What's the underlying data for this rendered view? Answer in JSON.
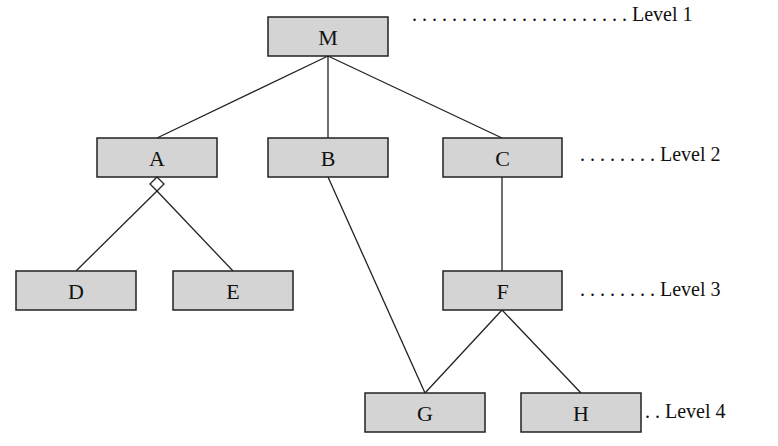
{
  "diagram": {
    "type": "hierarchy",
    "nodes": [
      {
        "id": "M",
        "label": "M",
        "level": 1,
        "x": 268,
        "y": 17,
        "w": 120,
        "h": 39
      },
      {
        "id": "A",
        "label": "A",
        "level": 2,
        "x": 97,
        "y": 138,
        "w": 120,
        "h": 39
      },
      {
        "id": "B",
        "label": "B",
        "level": 2,
        "x": 268,
        "y": 138,
        "w": 120,
        "h": 39
      },
      {
        "id": "C",
        "label": "C",
        "level": 2,
        "x": 443,
        "y": 138,
        "w": 119,
        "h": 39
      },
      {
        "id": "D",
        "label": "D",
        "level": 3,
        "x": 16,
        "y": 271,
        "w": 120,
        "h": 39
      },
      {
        "id": "E",
        "label": "E",
        "level": 3,
        "x": 173,
        "y": 271,
        "w": 120,
        "h": 39
      },
      {
        "id": "F",
        "label": "F",
        "level": 3,
        "x": 443,
        "y": 271,
        "w": 119,
        "h": 39
      },
      {
        "id": "G",
        "label": "G",
        "level": 4,
        "x": 365,
        "y": 393,
        "w": 120,
        "h": 39
      },
      {
        "id": "H",
        "label": "H",
        "level": 4,
        "x": 521,
        "y": 393,
        "w": 120,
        "h": 39
      }
    ],
    "edges": [
      {
        "from": "M",
        "to": "A",
        "x1": 328,
        "y1": 56,
        "x2": 157,
        "y2": 138
      },
      {
        "from": "M",
        "to": "B",
        "x1": 328,
        "y1": 56,
        "x2": 328,
        "y2": 138
      },
      {
        "from": "M",
        "to": "C",
        "x1": 328,
        "y1": 56,
        "x2": 502,
        "y2": 138
      },
      {
        "from": "A",
        "to": "D",
        "x1": 157,
        "y1": 191,
        "x2": 76,
        "y2": 271
      },
      {
        "from": "A",
        "to": "E",
        "x1": 157,
        "y1": 191,
        "x2": 233,
        "y2": 271
      },
      {
        "from": "B",
        "to": "G",
        "x1": 328,
        "y1": 177,
        "x2": 425,
        "y2": 393
      },
      {
        "from": "C",
        "to": "F",
        "x1": 502,
        "y1": 177,
        "x2": 502,
        "y2": 271
      },
      {
        "from": "F",
        "to": "G",
        "x1": 502,
        "y1": 310,
        "x2": 425,
        "y2": 393
      },
      {
        "from": "F",
        "to": "H",
        "x1": 502,
        "y1": 310,
        "x2": 581,
        "y2": 393
      }
    ],
    "aggregation_marker": {
      "node": "A",
      "shape": "diamond",
      "cx": 157,
      "cy": 184
    },
    "levels": [
      {
        "label": ". . . . . . . . . . . . . . . . . . . . . . Level 1",
        "x": 412,
        "y": 21
      },
      {
        "label": ". . . . . . . . Level 2",
        "x": 580,
        "y": 161
      },
      {
        "label": ". . . . . . . . Level 3",
        "x": 580,
        "y": 296
      },
      {
        "label": ". . Level 4",
        "x": 645,
        "y": 418
      }
    ]
  }
}
